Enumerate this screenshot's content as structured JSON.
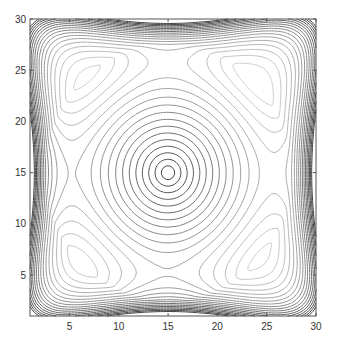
{
  "chart_data": {
    "type": "contour",
    "title": "",
    "xlabel": "",
    "ylabel": "",
    "xlim": [
      1,
      30
    ],
    "ylim": [
      1,
      30
    ],
    "xticks": [
      5,
      10,
      15,
      20,
      25,
      30
    ],
    "yticks": [
      5,
      10,
      15,
      20,
      25,
      30
    ],
    "center_peak": [
      15,
      15
    ],
    "grid": false,
    "legend": null,
    "num_levels": 20,
    "colormap": "gray"
  },
  "axes_box": {
    "left": 30,
    "top": 19,
    "right": 316,
    "bottom": 316
  },
  "colors": {
    "axis": "#555555",
    "line_dark": "#3a3a3a",
    "line_light": "#e6e6e6"
  }
}
